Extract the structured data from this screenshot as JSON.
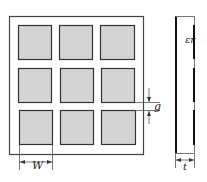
{
  "figure": {
    "front_view": {
      "grid_rows": 3,
      "grid_cols": 3,
      "patch_fill": "#d4d4d4",
      "patch_stroke": "#333333",
      "frame_stroke": "#444444"
    },
    "labels": {
      "width": "W",
      "gap": "g",
      "permittivity": "εr",
      "thickness": "t"
    }
  }
}
